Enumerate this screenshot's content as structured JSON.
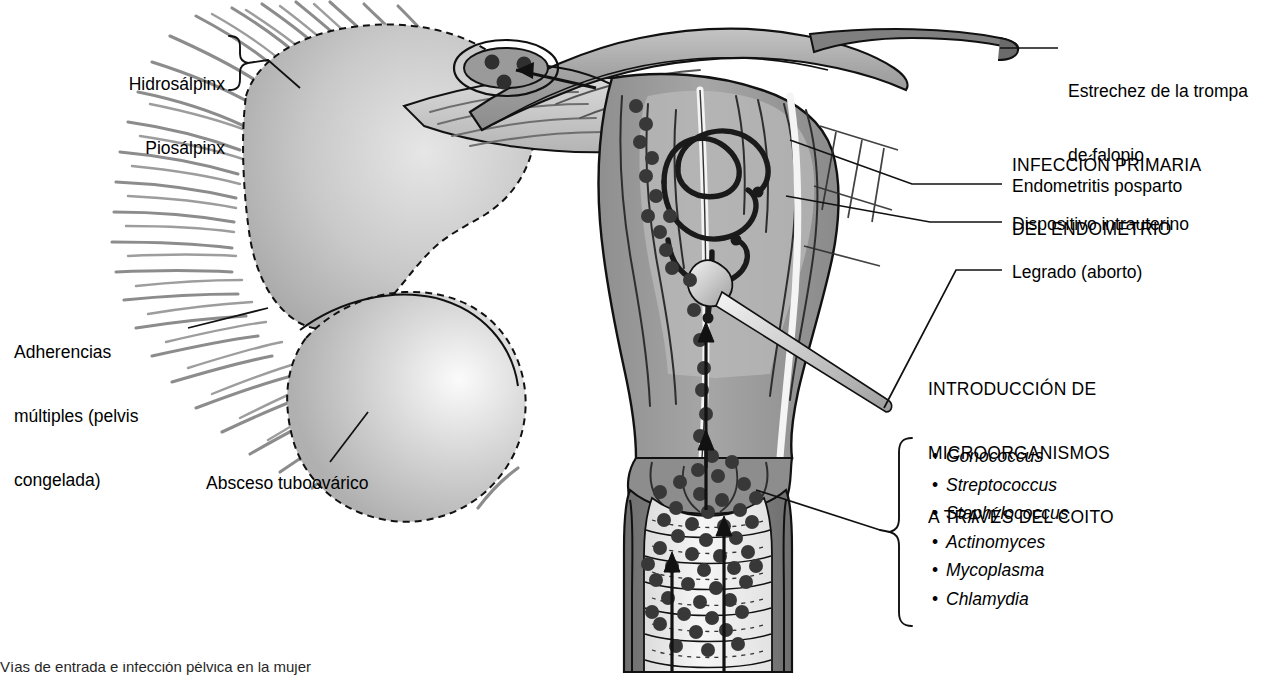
{
  "figure": {
    "title_caption": "Vías de entrada e infección pélvica en la mujer",
    "language": "es"
  },
  "colors": {
    "ink": "#000000",
    "tissue_mid": "#9a9a9a",
    "tissue_dark": "#7d7d7d",
    "tissue_light": "#d8d8d8",
    "lumen": "#f2f2f2",
    "adhesion": "#8c8c8c",
    "pathogen_dot": "#3a3a3a",
    "background": "#ffffff"
  },
  "labels": {
    "hidrosalpinx": "Hidrosálpinx",
    "piosalpinx": "Piosálpinx",
    "adherencias_l1": "Adherencias",
    "adherencias_l2": "múltiples (pelvis",
    "adherencias_l3": "congelada)",
    "absceso": "Absceso tuboovárico",
    "estrechez_l1": "Estrechez de la trompa",
    "estrechez_l2": "de falopio",
    "heading_infeccion_l1": "INFECCIÓN PRIMARIA",
    "heading_infeccion_l2": "DEL ENDOMETRIO",
    "endometritis": "Endometritis posparto",
    "diu": "Dispositivo intrauterino",
    "legrado": "Legrado (aborto)",
    "heading_coito_l1": "INTRODUCCIÓN DE",
    "heading_coito_l2": "MICROORGANISMOS",
    "heading_coito_l3": "A TRAVÉS DEL COITO"
  },
  "organisms": [
    "Gonococcus",
    "Streptococcus",
    "Staphylococcus",
    "Actinomyces",
    "Mycoplasma",
    "Chlamydia"
  ],
  "anatomy_parts": [
    "trompa-de-falopio-izquierda",
    "fimbrias",
    "hidrosalpinx-piosalpinx-mass",
    "absceso-tuboovarico",
    "adherencias-pelvicas",
    "utero",
    "cavidad-endometrial",
    "dispositivo-intrauterino",
    "cureta-legrado",
    "canal-cervical",
    "cervix",
    "vagina",
    "pliegues-vaginales",
    "trompa-de-falopio-derecha-estrecha"
  ],
  "flow_arrows": {
    "count": 4,
    "direction": "ascendente",
    "meaning": "ascenso de microorganismos desde la vagina hacia la trompa"
  }
}
